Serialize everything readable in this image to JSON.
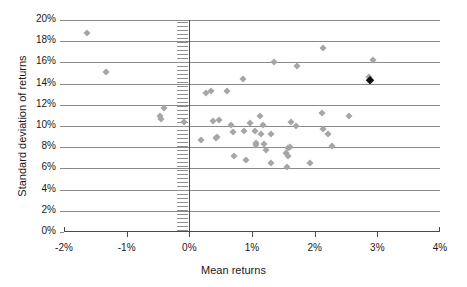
{
  "chart_data": {
    "type": "scatter",
    "title": "",
    "xlabel": "Mean returns",
    "ylabel": "Standard deviation of returns",
    "xlim": [
      -2,
      4
    ],
    "ylim": [
      0,
      20
    ],
    "xticks": [
      "-2%",
      "-1%",
      "0%",
      "1%",
      "2%",
      "3%",
      "4%"
    ],
    "xtick_values": [
      -2,
      -1,
      0,
      1,
      2,
      3,
      4
    ],
    "yticks": [
      "0%",
      "2%",
      "4%",
      "6%",
      "8%",
      "10%",
      "12%",
      "14%",
      "16%",
      "18%",
      "20%"
    ],
    "ytick_values": [
      0,
      2,
      4,
      6,
      8,
      10,
      12,
      14,
      16,
      18,
      20
    ],
    "grid": "horizontal",
    "legend": "none",
    "marker": "diamond",
    "marker_color": "#a6a6a6",
    "highlight_color": "#111111",
    "reference_line_x": 0,
    "points": [
      {
        "x": -1.63,
        "y": 18.8
      },
      {
        "x": -1.33,
        "y": 15.1
      },
      {
        "x": -0.41,
        "y": 11.7
      },
      {
        "x": -0.47,
        "y": 10.9
      },
      {
        "x": -0.45,
        "y": 10.7
      },
      {
        "x": -0.09,
        "y": 10.4
      },
      {
        "x": 0.19,
        "y": 8.7
      },
      {
        "x": 0.26,
        "y": 13.1
      },
      {
        "x": 0.35,
        "y": 13.3
      },
      {
        "x": 0.6,
        "y": 13.3
      },
      {
        "x": 0.38,
        "y": 10.5
      },
      {
        "x": 0.47,
        "y": 10.6
      },
      {
        "x": 0.44,
        "y": 9.0
      },
      {
        "x": 0.43,
        "y": 8.9
      },
      {
        "x": 0.67,
        "y": 10.1
      },
      {
        "x": 0.7,
        "y": 9.4
      },
      {
        "x": 0.71,
        "y": 7.2
      },
      {
        "x": 0.86,
        "y": 14.4
      },
      {
        "x": 0.88,
        "y": 9.5
      },
      {
        "x": 0.9,
        "y": 6.8
      },
      {
        "x": 0.97,
        "y": 10.3
      },
      {
        "x": 1.05,
        "y": 9.5
      },
      {
        "x": 1.06,
        "y": 8.4
      },
      {
        "x": 1.07,
        "y": 8.2
      },
      {
        "x": 1.13,
        "y": 10.9
      },
      {
        "x": 1.18,
        "y": 10.1
      },
      {
        "x": 1.14,
        "y": 9.2
      },
      {
        "x": 1.19,
        "y": 8.3
      },
      {
        "x": 1.22,
        "y": 7.7
      },
      {
        "x": 1.31,
        "y": 9.2
      },
      {
        "x": 1.31,
        "y": 6.5
      },
      {
        "x": 1.35,
        "y": 16.0
      },
      {
        "x": 1.55,
        "y": 7.5
      },
      {
        "x": 1.57,
        "y": 7.2
      },
      {
        "x": 1.58,
        "y": 7.9
      },
      {
        "x": 1.6,
        "y": 8.0
      },
      {
        "x": 1.56,
        "y": 6.1
      },
      {
        "x": 1.62,
        "y": 10.4
      },
      {
        "x": 1.7,
        "y": 10.0
      },
      {
        "x": 1.72,
        "y": 15.7
      },
      {
        "x": 1.93,
        "y": 6.5
      },
      {
        "x": 2.11,
        "y": 11.2
      },
      {
        "x": 2.13,
        "y": 17.4
      },
      {
        "x": 2.14,
        "y": 9.7
      },
      {
        "x": 2.22,
        "y": 9.2
      },
      {
        "x": 2.28,
        "y": 8.1
      },
      {
        "x": 2.55,
        "y": 10.9
      },
      {
        "x": 2.86,
        "y": 14.6
      },
      {
        "x": 2.93,
        "y": 16.2
      },
      {
        "x": 2.88,
        "y": 14.3,
        "highlight": true
      }
    ]
  }
}
